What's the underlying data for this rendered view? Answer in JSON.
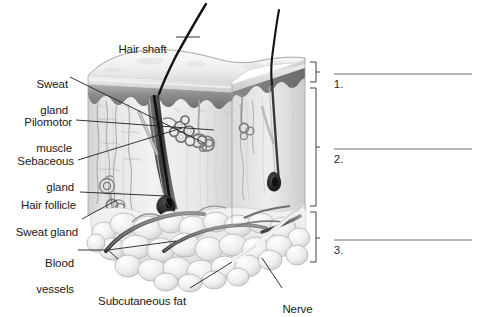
{
  "figure": {
    "background_color": "#ffffff",
    "ink_color": "#1a1a1a",
    "line_color": "#3a3a3a"
  },
  "labels": [
    {
      "id": "hair-shaft",
      "text": "Hair shaft",
      "lines": [
        "Hair shaft"
      ]
    },
    {
      "id": "sweat-gland-top",
      "text": "Sweat gland",
      "lines": [
        "Sweat",
        "gland"
      ]
    },
    {
      "id": "pilomotor-muscle",
      "text": "Pilomotor muscle",
      "lines": [
        "Pilomotor",
        "muscle"
      ]
    },
    {
      "id": "sebaceous-gland",
      "text": "Sebaceous gland",
      "lines": [
        "Sebaceous",
        "gland"
      ]
    },
    {
      "id": "hair-follicle",
      "text": "Hair follicle",
      "lines": [
        "Hair follicle"
      ]
    },
    {
      "id": "sweat-gland-low",
      "text": "Sweat gland",
      "lines": [
        "Sweat gland"
      ]
    },
    {
      "id": "blood-vessels",
      "text": "Blood vessels",
      "lines": [
        "Blood",
        "vessels"
      ]
    },
    {
      "id": "subcutaneous-fat",
      "text": "Subcutaneous fat",
      "lines": [
        "Subcutaneous fat"
      ]
    },
    {
      "id": "nerve",
      "text": "Nerve",
      "lines": [
        "Nerve"
      ]
    }
  ],
  "label_text": {
    "hair_shaft": "Hair shaft",
    "sweat_top_1": "Sweat",
    "sweat_top_2": "gland",
    "pilomotor_1": "Pilomotor",
    "pilomotor_2": "muscle",
    "sebaceous_1": "Sebaceous",
    "sebaceous_2": "gland",
    "hair_follicle": "Hair follicle",
    "sweat_gland_low": "Sweat gland",
    "blood_1": "Blood",
    "blood_2": "vessels",
    "subcutaneous_fat": "Subcutaneous fat",
    "nerve": "Nerve"
  },
  "brackets": [
    {
      "id": "bracket-1",
      "number": "1.",
      "layer_span": "epidermis",
      "answer": ""
    },
    {
      "id": "bracket-2",
      "number": "2.",
      "layer_span": "dermis",
      "answer": ""
    },
    {
      "id": "bracket-3",
      "number": "3.",
      "layer_span": "subcutaneous fat",
      "answer": ""
    }
  ],
  "bracket_numbers": {
    "one": "1.",
    "two": "2.",
    "three": "3."
  },
  "answer_lines": {
    "count": 3,
    "values": [
      "",
      "",
      ""
    ]
  }
}
